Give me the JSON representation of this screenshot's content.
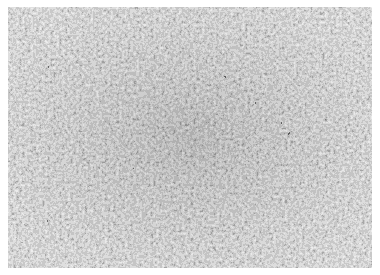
{
  "image": {
    "subject": "grayscale metallographic micrograph of fine grain structure",
    "palette": {
      "background": "#ffffff",
      "grain_light": "#d8d8d8",
      "grain_mid": "#a8a8a8",
      "boundary_dark": "#3a3a3a",
      "base": "#9a9a9a"
    },
    "layout": {
      "frame_x": 8,
      "frame_y": 7,
      "frame_w": 364,
      "frame_h": 261
    }
  }
}
